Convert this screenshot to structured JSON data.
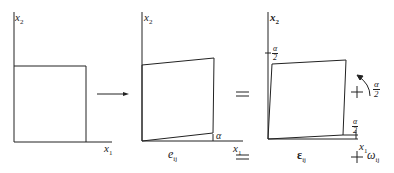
{
  "diagram": {
    "panels": [
      {
        "id": "original",
        "axes": {
          "x_label": "x₁",
          "y_label": "x₂"
        },
        "shape": "square"
      },
      {
        "id": "deformed",
        "axes": {
          "x_label": "x₁",
          "y_label": "x₂"
        },
        "shape": "sheared quadrilateral",
        "angle_label": "α",
        "caption": "eᵢⱼ"
      },
      {
        "id": "pure-strain",
        "axes": {
          "x_label": "x₁",
          "y_label": "x₂"
        },
        "shape": "symmetrically sheared square",
        "top_angle_label": {
          "num": "α",
          "den": "2"
        },
        "bottom_angle_label": {
          "num": "α",
          "den": "2"
        },
        "caption": "εᵢⱼ"
      },
      {
        "id": "rotation",
        "rotation_label": {
          "num": "α",
          "den": "2"
        },
        "caption": "ωᵢⱼ"
      }
    ],
    "operators": {
      "arrow": "→",
      "equals": "=",
      "plus": "+"
    },
    "labels": {
      "x1": "x",
      "x2": "x",
      "sub1": "1",
      "sub2": "2",
      "alpha": "α",
      "two": "2",
      "e": "e",
      "epsilon": "ε",
      "omega": "ω",
      "ij": "ij"
    }
  }
}
